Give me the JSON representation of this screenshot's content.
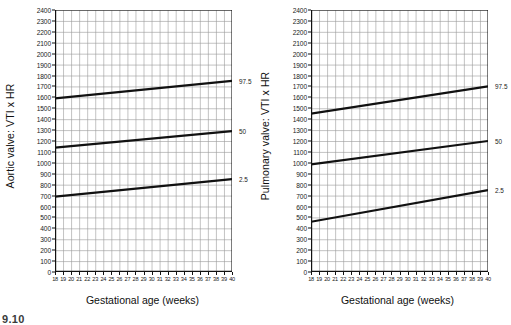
{
  "figure": {
    "caption": "9.10"
  },
  "axes": {
    "x_title": "Gestational age (weeks)",
    "x_ticks": [
      18,
      19,
      20,
      21,
      22,
      23,
      24,
      25,
      26,
      27,
      28,
      29,
      30,
      31,
      32,
      33,
      34,
      35,
      36,
      37,
      38,
      39,
      40
    ],
    "y_ticks": [
      2400,
      2300,
      2200,
      2100,
      2000,
      1900,
      1800,
      1700,
      1600,
      1500,
      1400,
      1300,
      1200,
      1100,
      1000,
      900,
      800,
      700,
      600,
      500,
      400,
      300,
      200,
      100,
      0
    ],
    "xlim": [
      18,
      40
    ],
    "ylim": [
      0,
      2400
    ]
  },
  "panels": [
    {
      "id": "aortic",
      "y_title": "Aortic valve: VTI x HR",
      "percentile_labels": [
        "97.5",
        "50",
        "2.5"
      ]
    },
    {
      "id": "pulmonary",
      "y_title": "Pulmonary valve: VTI x HR",
      "percentile_labels": [
        "97.5",
        "50",
        "2.5"
      ]
    }
  ],
  "chart_data": [
    {
      "type": "line",
      "title": "Aortic valve: VTI x HR",
      "xlabel": "Gestational age (weeks)",
      "ylabel": "Aortic valve: VTI x HR",
      "xlim": [
        18,
        40
      ],
      "ylim": [
        0,
        2400
      ],
      "grid": true,
      "x": [
        18,
        40
      ],
      "series": [
        {
          "name": "97.5",
          "values": [
            1590,
            1750
          ]
        },
        {
          "name": "50",
          "values": [
            1140,
            1290
          ]
        },
        {
          "name": "2.5",
          "values": [
            690,
            850
          ]
        }
      ]
    },
    {
      "type": "line",
      "title": "Pulmonary valve: VTI x HR",
      "xlabel": "Gestational age (weeks)",
      "ylabel": "Pulmonary valve: VTI x HR",
      "xlim": [
        18,
        40
      ],
      "ylim": [
        0,
        2400
      ],
      "grid": true,
      "x": [
        18,
        40
      ],
      "series": [
        {
          "name": "97.5",
          "values": [
            1450,
            1700
          ]
        },
        {
          "name": "50",
          "values": [
            985,
            1200
          ]
        },
        {
          "name": "2.5",
          "values": [
            460,
            750
          ]
        }
      ]
    }
  ]
}
